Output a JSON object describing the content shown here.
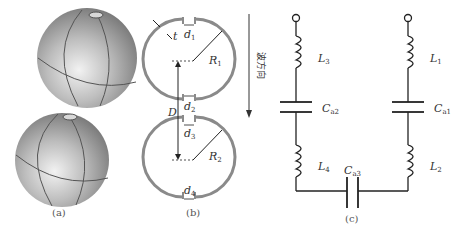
{
  "figure": {
    "panels": [
      {
        "id": "a",
        "caption": "(a)",
        "description": "3D rendering of two stacked spherical shells with openings"
      },
      {
        "id": "b",
        "caption": "(b)",
        "description": "Cross-section of two open spherical shells"
      },
      {
        "id": "c",
        "caption": "(c)",
        "description": "Equivalent LC circuit"
      }
    ],
    "panel_b": {
      "labels": {
        "t": "t",
        "d1": "d",
        "d1_sub": "1",
        "d2": "d",
        "d2_sub": "2",
        "d3": "d",
        "d3_sub": "3",
        "d4": "d",
        "d4_sub": "4",
        "R1": "R",
        "R1_sub": "1",
        "R2": "R",
        "R2_sub": "2",
        "D": "D"
      },
      "direction_label": "波方向"
    },
    "panel_c": {
      "components": {
        "L3": "L",
        "L3_sub": "3",
        "L1": "L",
        "L1_sub": "1",
        "Ca2": "C",
        "Ca2_sub": "a2",
        "Ca1": "C",
        "Ca1_sub": "a1",
        "L4": "L",
        "L4_sub": "4",
        "L2": "L",
        "L2_sub": "2",
        "Ca3": "C",
        "Ca3_sub": "a3"
      }
    },
    "colors": {
      "shell": "#8a8a8a",
      "sphere_light": "#e6e6e6",
      "sphere_dark": "#7a7a7a",
      "line": "#333333"
    }
  }
}
